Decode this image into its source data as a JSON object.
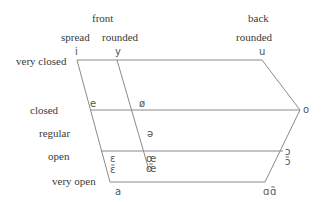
{
  "diagram": {
    "type": "vowel-trapezoid",
    "column_headers": {
      "front": "front",
      "front_spread": "spread",
      "front_rounded": "rounded",
      "back": "back",
      "back_rounded": "rounded"
    },
    "row_labels": {
      "very_closed": "very closed",
      "closed": "closed",
      "regular": "regular",
      "open": "open",
      "very_open": "very open"
    },
    "vowels": {
      "i": "i",
      "y": "y",
      "u": "u",
      "e": "e",
      "o_slash": "ø",
      "o": "o",
      "schwa": "ə",
      "epsilon": "ɛ",
      "epsilon_nasal": "ɛ̃",
      "oe": "œ",
      "oe_nasal": "œ̃",
      "open_o": "ɔ",
      "open_o_nasal": "ɔ̃",
      "a": "a",
      "alpha": "ɑ",
      "alpha_nasal": "ɑ̃"
    },
    "line_color": "#8a8a8a",
    "text_color": "#3a3a3a"
  }
}
